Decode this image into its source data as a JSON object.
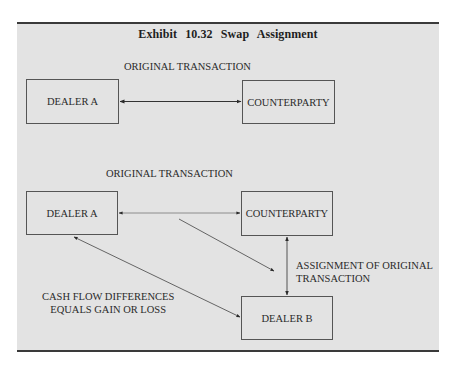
{
  "exhibit": {
    "title": "Exhibit 10.32    Swap Assignment"
  },
  "top_section": {
    "caption": "ORIGINAL TRANSACTION",
    "boxes": {
      "dealer_a": "DEALER A",
      "counterparty": "COUNTERPARTY"
    },
    "arrow": "bidirectional between DEALER A and COUNTERPARTY"
  },
  "bottom_section": {
    "caption": "ORIGINAL TRANSACTION",
    "boxes": {
      "dealer_a": "DEALER A",
      "counterparty": "COUNTERPARTY",
      "dealer_b": "DEALER B"
    },
    "assignment_label_line1": "ASSIGNMENT OF ORIGINAL",
    "assignment_label_line2": "TRANSACTION",
    "cash_flow_label_line1": "CASH FLOW DIFFERENCES",
    "cash_flow_label_line2": "EQUALS GAIN OR LOSS"
  },
  "colors": {
    "panel_background": "#e3e3e3",
    "rule": "#3a3a3a",
    "box_border": "#555555",
    "text": "#2a2a2a"
  }
}
